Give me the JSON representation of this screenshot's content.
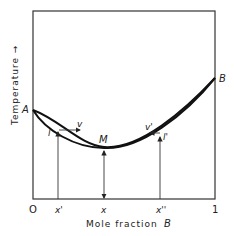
{
  "figure": {
    "y_axis_label": "Temperature →",
    "x_axis_label": "Mole fraction",
    "x_axis_symbol": "B",
    "x_ticks": [
      {
        "label": "O",
        "pos": 0
      },
      {
        "label": "x'",
        "pos": 0.39
      },
      {
        "label": "x",
        "pos": 0.39
      },
      {
        "label": "x''",
        "pos": 0.71
      },
      {
        "label": "1",
        "pos": 1
      }
    ],
    "points": {
      "A": "A",
      "B": "B",
      "M": "M",
      "v": "v",
      "l": "l",
      "v_prime": "v'",
      "l_prime": "l'"
    },
    "tick_labels": {
      "zero": "O",
      "x_prime": "x'",
      "x": "x",
      "x_double_prime": "x''",
      "one": "1"
    }
  }
}
